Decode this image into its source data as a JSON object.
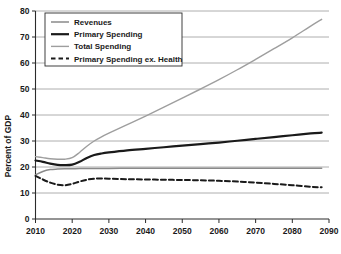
{
  "chart_data": {
    "type": "line",
    "title": "",
    "xlabel": "",
    "ylabel": "Percent of GDP",
    "xlim": [
      2010,
      2090
    ],
    "ylim": [
      0,
      80
    ],
    "grid": true,
    "legend_position": "top-left",
    "xticks": [
      "2010",
      "2020",
      "2030",
      "2040",
      "2050",
      "2060",
      "2070",
      "2080",
      "2090"
    ],
    "yticks": [
      "0",
      "10",
      "20",
      "30",
      "40",
      "50",
      "60",
      "70",
      "80"
    ],
    "x": [
      2010,
      2012,
      2014,
      2016,
      2018,
      2020,
      2022,
      2024,
      2026,
      2028,
      2030,
      2035,
      2040,
      2045,
      2050,
      2055,
      2060,
      2065,
      2070,
      2075,
      2080,
      2085,
      2088
    ],
    "series": [
      {
        "name": "Revenues",
        "color": "#8a8a8a",
        "width": 1.5,
        "dash": "none",
        "values": [
          17.0,
          18.3,
          19.0,
          19.2,
          19.3,
          19.35,
          19.4,
          19.4,
          19.42,
          19.45,
          19.45,
          19.5,
          19.5,
          19.5,
          19.5,
          19.5,
          19.5,
          19.5,
          19.5,
          19.5,
          19.5,
          19.5,
          19.5
        ]
      },
      {
        "name": "Primary Spending",
        "color": "#1a1a1a",
        "width": 2.2,
        "dash": "none",
        "values": [
          22.5,
          22.0,
          21.3,
          20.8,
          20.7,
          20.9,
          22.0,
          23.5,
          24.6,
          25.2,
          25.6,
          26.4,
          27.0,
          27.6,
          28.2,
          28.8,
          29.4,
          30.1,
          30.8,
          31.5,
          32.2,
          32.9,
          33.2
        ]
      },
      {
        "name": "Total Spending",
        "color": "#9e9e9e",
        "width": 1.4,
        "dash": "none",
        "values": [
          24.0,
          23.6,
          23.2,
          23.0,
          23.0,
          23.6,
          25.6,
          28.0,
          30.0,
          31.6,
          33.0,
          36.3,
          39.6,
          43.0,
          46.5,
          50.0,
          53.6,
          57.4,
          61.4,
          65.5,
          69.7,
          74.2,
          76.8
        ]
      },
      {
        "name": "Primary Spending ex. Health",
        "color": "#1a1a1a",
        "width": 2.0,
        "dash": "5,3",
        "values": [
          16.6,
          15.2,
          14.0,
          13.2,
          13.0,
          13.5,
          14.4,
          15.1,
          15.5,
          15.6,
          15.5,
          15.3,
          15.2,
          15.1,
          15.0,
          14.9,
          14.7,
          14.4,
          14.0,
          13.5,
          13.0,
          12.4,
          12.2
        ]
      }
    ]
  },
  "legend": {
    "items": [
      {
        "label": "Revenues"
      },
      {
        "label": "Primary Spending"
      },
      {
        "label": "Total Spending"
      },
      {
        "label": "Primary Spending ex. Health"
      }
    ]
  }
}
